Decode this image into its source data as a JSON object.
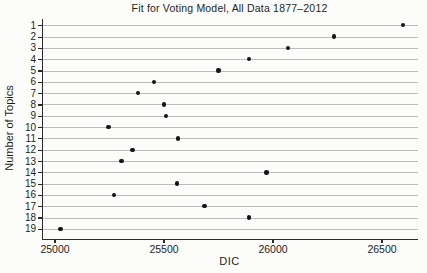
{
  "chart_data": {
    "type": "scatter",
    "title": "Fit for Voting Model, All Data 1877–2012",
    "xlabel": "DIC",
    "ylabel": "Number of Topics",
    "xlim": [
      24945,
      26665
    ],
    "x_ticks": [
      25000,
      25500,
      26000,
      26500
    ],
    "y_categories": [
      1,
      2,
      3,
      4,
      5,
      6,
      7,
      8,
      9,
      10,
      11,
      12,
      13,
      14,
      15,
      16,
      17,
      18,
      19
    ],
    "grid": "horizontal",
    "legend": "none",
    "point_color": "#141414",
    "grid_color": "#bdbdbd",
    "points": [
      {
        "topic": 1,
        "dic": 26595
      },
      {
        "topic": 2,
        "dic": 26280
      },
      {
        "topic": 3,
        "dic": 26070
      },
      {
        "topic": 4,
        "dic": 25890
      },
      {
        "topic": 5,
        "dic": 25750
      },
      {
        "topic": 6,
        "dic": 25455
      },
      {
        "topic": 7,
        "dic": 25380
      },
      {
        "topic": 8,
        "dic": 25500
      },
      {
        "topic": 9,
        "dic": 25510
      },
      {
        "topic": 10,
        "dic": 25245
      },
      {
        "topic": 11,
        "dic": 25565
      },
      {
        "topic": 12,
        "dic": 25355
      },
      {
        "topic": 13,
        "dic": 25305
      },
      {
        "topic": 14,
        "dic": 25970
      },
      {
        "topic": 15,
        "dic": 25560
      },
      {
        "topic": 16,
        "dic": 25270
      },
      {
        "topic": 17,
        "dic": 25685
      },
      {
        "topic": 18,
        "dic": 25890
      },
      {
        "topic": 19,
        "dic": 25025
      }
    ]
  }
}
